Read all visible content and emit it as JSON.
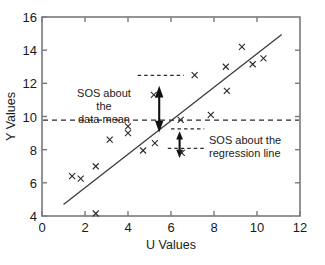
{
  "chart_data": {
    "type": "scatter",
    "title": "",
    "xlabel": "U Values",
    "ylabel": "Y Values",
    "xlim": [
      0,
      12
    ],
    "ylim": [
      4,
      16
    ],
    "xticks": [
      0,
      2,
      4,
      6,
      8,
      10,
      12
    ],
    "yticks": [
      4,
      6,
      8,
      10,
      12,
      14,
      16
    ],
    "grid": false,
    "legend": "none",
    "marker": "x",
    "series": [
      {
        "name": "observations",
        "x": [
          1.4,
          1.8,
          2.5,
          2.5,
          3.15,
          4.0,
          4.0,
          4.7,
          5.2,
          5.25,
          6.45,
          6.5,
          7.1,
          7.85,
          8.55,
          8.6,
          9.3,
          9.8,
          10.3
        ],
        "y": [
          6.4,
          6.25,
          7.0,
          4.15,
          8.6,
          9.4,
          9.0,
          7.95,
          11.3,
          8.4,
          9.8,
          7.8,
          12.5,
          10.1,
          13.0,
          11.55,
          14.2,
          13.15,
          13.5
        ]
      }
    ],
    "lines": [
      {
        "name": "regression-line",
        "style": "solid",
        "x": [
          1.0,
          11.15
        ],
        "y": [
          4.7,
          14.95
        ]
      },
      {
        "name": "data-mean-line",
        "style": "dashed",
        "x": [
          0,
          12
        ],
        "y": [
          9.78,
          9.78
        ]
      },
      {
        "name": "sos-mean-upper-reference",
        "style": "dashed",
        "x": [
          4.45,
          6.6
        ],
        "y": [
          12.48,
          12.48
        ]
      },
      {
        "name": "sos-regression-upper-reference",
        "style": "dashed",
        "x": [
          6.0,
          7.55
        ],
        "y": [
          9.25,
          9.25
        ]
      },
      {
        "name": "sos-regression-lower-reference",
        "style": "dashed",
        "x": [
          5.85,
          7.6
        ],
        "y": [
          8.08,
          8.08
        ]
      }
    ],
    "arrows": [
      {
        "name": "sos-about-data-mean-arrow",
        "double_headed": true,
        "x": 5.45,
        "y_from": 12.4,
        "y_to": 9.85
      },
      {
        "name": "sos-about-regression-line-arrow",
        "double_headed": true,
        "x": 6.4,
        "y_from": 9.72,
        "y_to": 8.16
      }
    ],
    "annotations": [
      {
        "name": "sos-about-data-mean-label",
        "lines": [
          "SOS about",
          "the",
          "data mean"
        ],
        "align": "center"
      },
      {
        "name": "sos-about-regression-line-label",
        "lines": [
          "SOS about the",
          "regression line"
        ],
        "align": "left"
      }
    ],
    "colors": {
      "background": "#ffffff",
      "axis": "#7a7a7a",
      "marker": "#2a2a2a",
      "regression_line": "#3b3b3b",
      "dashed_line": "#2b2b2b",
      "text": "#1a1a1a"
    }
  }
}
